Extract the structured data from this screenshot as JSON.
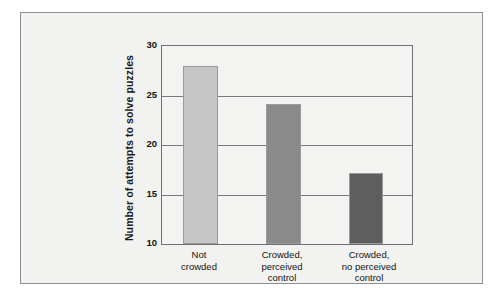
{
  "chart_data": {
    "type": "bar",
    "title": "",
    "subtitle": "",
    "xlabel": "",
    "ylabel": "Number of attempts to solve puzzles",
    "categories": [
      "Not crowded",
      "Crowded, perceived control",
      "Crowded, no perceived control"
    ],
    "category_lines": [
      [
        "Not",
        "crowded"
      ],
      [
        "Crowded,",
        "perceived",
        "control"
      ],
      [
        "Crowded,",
        "no perceived",
        "control"
      ]
    ],
    "values": [
      28.0,
      24.1,
      17.2
    ],
    "ylim": [
      10,
      30
    ],
    "yticks": [
      30,
      25,
      20,
      15,
      10
    ],
    "ytick_labels": [
      "30",
      "25",
      "20",
      "15",
      "10"
    ],
    "grid": true,
    "grid_axis": "y",
    "legend": "none",
    "bar_colors": [
      "#c6c6c6",
      "#8a8a8a",
      "#5e5e5e"
    ],
    "plot_background": "#f3f3f1",
    "figure_background": "#f2f2f0",
    "axis_color": "#6f6f6f",
    "text_color": "#141414"
  },
  "figure": {
    "border_color": "#8e8e8e"
  }
}
